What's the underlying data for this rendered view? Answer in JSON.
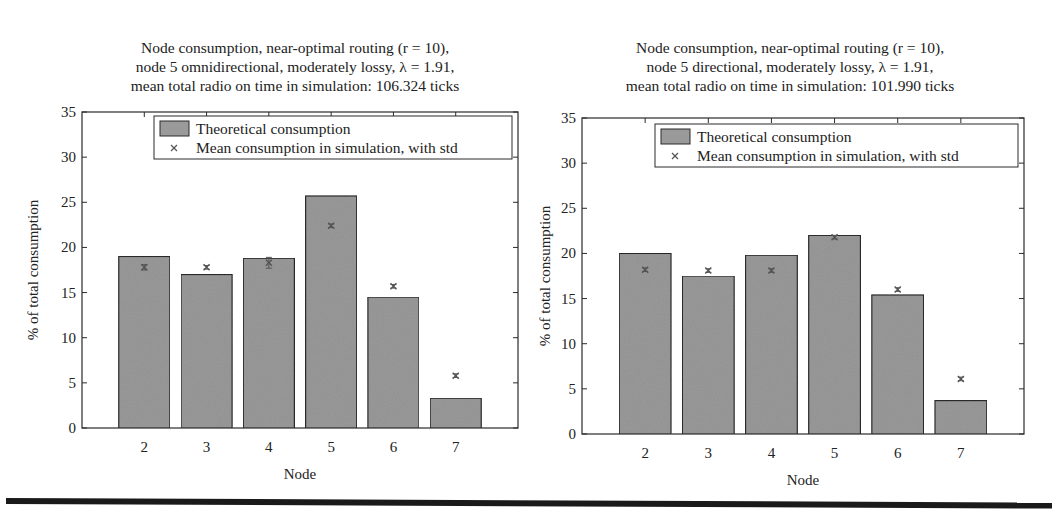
{
  "chart_data": [
    {
      "type": "bar",
      "title_lines": [
        "Node consumption, near-optimal routing (r = 10),",
        "node 5 omnidirectional, moderately lossy, λ = 1.91,",
        "mean total radio on time in simulation: 106.324 ticks"
      ],
      "xlabel": "Node",
      "ylabel": "% of total consumption",
      "categories": [
        "2",
        "3",
        "4",
        "5",
        "6",
        "7"
      ],
      "ylim": [
        0,
        35
      ],
      "yticks": [
        "0",
        "5",
        "10",
        "15",
        "20",
        "25",
        "30",
        "35"
      ],
      "legend": {
        "position": "top-right",
        "entries": [
          "Theoretical consumption",
          "Mean consumption in simulation, with std"
        ]
      },
      "series": [
        {
          "name": "Theoretical consumption",
          "kind": "bar",
          "values": [
            19.0,
            17.0,
            18.8,
            25.7,
            14.5,
            3.3
          ]
        },
        {
          "name": "Mean consumption in simulation, with std",
          "kind": "marker",
          "values": [
            17.8,
            17.8,
            18.3,
            22.4,
            15.7,
            5.8
          ],
          "std": [
            0.3,
            0.2,
            0.6,
            0.2,
            0.2,
            0.2
          ]
        }
      ],
      "grid": false,
      "colors": {
        "bar": "#9a9a9a",
        "bar_edge": "#2a2a2a",
        "marker": "#555555"
      }
    },
    {
      "type": "bar",
      "title_lines": [
        "Node consumption, near-optimal routing (r = 10),",
        "node 5 directional,  moderately lossy, λ = 1.91,",
        "mean total radio on time in simulation: 101.990 ticks"
      ],
      "xlabel": "Node",
      "ylabel": "% of total consumption",
      "categories": [
        "2",
        "3",
        "4",
        "5",
        "6",
        "7"
      ],
      "ylim": [
        0,
        35
      ],
      "yticks": [
        "0",
        "5",
        "10",
        "15",
        "20",
        "25",
        "30",
        "35"
      ],
      "legend": {
        "position": "top-right",
        "entries": [
          "Theoretical consumption",
          "Mean consumption in simulation, with std"
        ]
      },
      "series": [
        {
          "name": "Theoretical consumption",
          "kind": "bar",
          "values": [
            20.0,
            17.5,
            19.8,
            22.0,
            15.4,
            3.7
          ]
        },
        {
          "name": "Mean consumption in simulation, with std",
          "kind": "marker",
          "values": [
            18.2,
            18.1,
            18.1,
            21.8,
            16.0,
            6.1
          ],
          "std": [
            0.2,
            0.2,
            0.2,
            0.2,
            0.2,
            0.2
          ]
        }
      ],
      "grid": false,
      "colors": {
        "bar": "#9a9a9a",
        "bar_edge": "#2a2a2a",
        "marker": "#555555"
      }
    }
  ]
}
